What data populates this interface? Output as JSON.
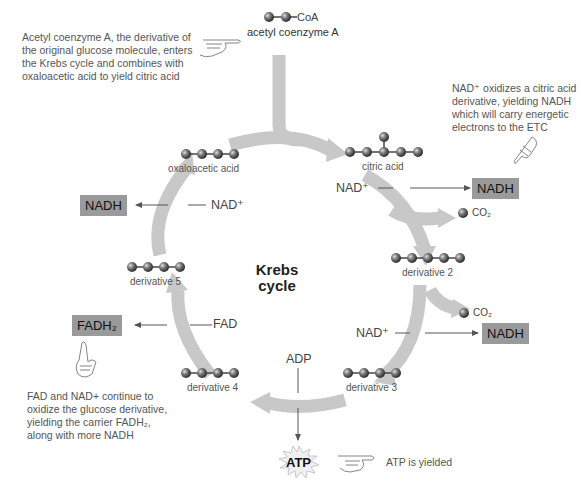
{
  "notes": {
    "acetyl_intro": [
      "Acetyl coenzyme A, the derivative of",
      "the original glucose molecule, enters",
      "the Krebs cycle and combines with",
      "oxaloacetic acid to yield citric acid"
    ],
    "nad_oxidizes": [
      "NAD⁺ oxidizes a citric acid",
      "derivative, yielding NADH",
      "which will carry energetic",
      "electrons to the ETC"
    ],
    "fad_nad": [
      "FAD and NAD+ continue to",
      "oxidize the glucose derivative,",
      "yielding the carrier FADH₂,",
      "along with more NADH"
    ],
    "atp_yielded": "ATP is yielded"
  },
  "center_title": [
    "Krebs",
    "cycle"
  ],
  "molecules": {
    "acetyl_coa_tag": "CoA",
    "acetyl_coa": "acetyl coenzyme A",
    "citric_acid": "citric acid",
    "derivative_2": "derivative 2",
    "derivative_3": "derivative 3",
    "derivative_4": "derivative 4",
    "derivative_5": "derivative 5",
    "oxaloacetic_acid": "oxaloacetic acid"
  },
  "inputs": {
    "nad_1": "NAD⁺",
    "nad_2": "NAD⁺",
    "nad_3": "NAD⁺",
    "fad": "FAD",
    "adp": "ADP"
  },
  "products": {
    "nadh_1": "NADH",
    "nadh_2": "NADH",
    "nadh_3": "NADH",
    "fadh2": "FADH₂",
    "atp": "ATP",
    "co2_1": "CO₂",
    "co2_2": "CO₂"
  },
  "colors": {
    "arrow": "#c8c8c8",
    "box": "#9a9a9a",
    "sphere": "#666666"
  }
}
